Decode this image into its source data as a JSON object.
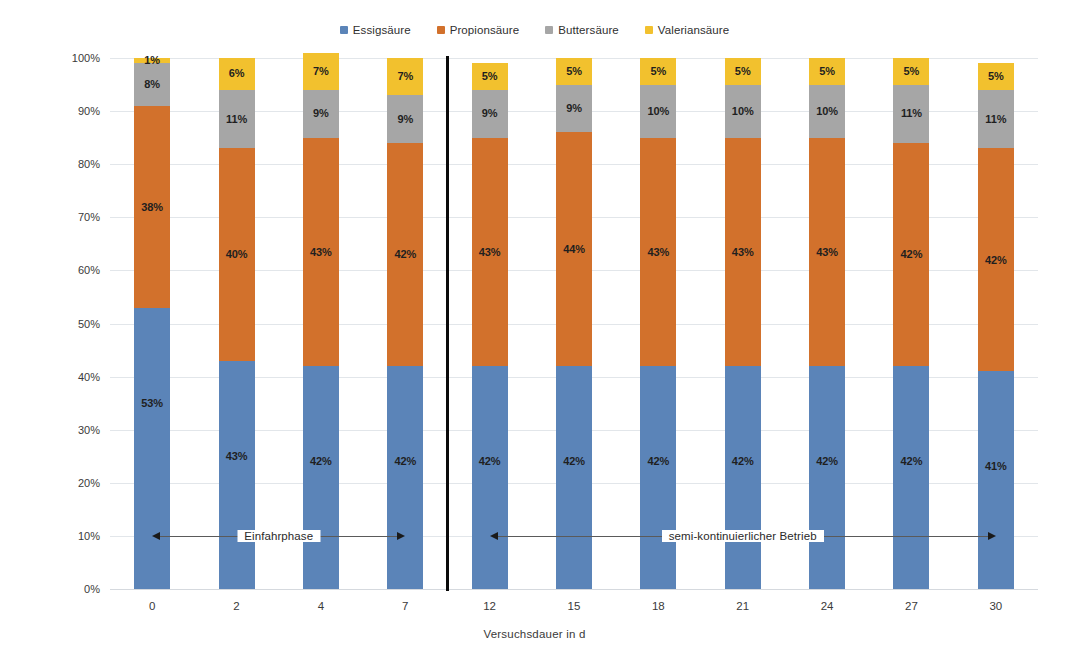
{
  "chart_data": {
    "type": "bar",
    "variant": "100% stacked column",
    "title": "",
    "xlabel": "Versuchsdauer in d",
    "ylabel": "Stoffmengenanteil",
    "categories": [
      "0",
      "2",
      "4",
      "7",
      "12",
      "15",
      "18",
      "21",
      "24",
      "27",
      "30"
    ],
    "ylim": [
      0,
      100
    ],
    "ytick_labels": [
      "0%",
      "10%",
      "20%",
      "30%",
      "40%",
      "50%",
      "60%",
      "70%",
      "80%",
      "90%",
      "100%"
    ],
    "ytick_values": [
      0,
      10,
      20,
      30,
      40,
      50,
      60,
      70,
      80,
      90,
      100
    ],
    "grid": true,
    "legend_position": "top-center",
    "series": [
      {
        "name": "Essigsäure",
        "color": "#5b84b8",
        "values": [
          53,
          43,
          42,
          42,
          42,
          42,
          42,
          42,
          42,
          42,
          41
        ],
        "labels": [
          "53%",
          "43%",
          "42%",
          "42%",
          "42%",
          "42%",
          "42%",
          "42%",
          "42%",
          "42%",
          "41%"
        ]
      },
      {
        "name": "Propionsäure",
        "color": "#d2712c",
        "values": [
          38,
          40,
          43,
          42,
          43,
          44,
          43,
          43,
          43,
          42,
          42
        ],
        "labels": [
          "38%",
          "40%",
          "43%",
          "42%",
          "43%",
          "44%",
          "43%",
          "43%",
          "43%",
          "42%",
          "42%"
        ]
      },
      {
        "name": "Buttersäure",
        "color": "#a6a6a6",
        "values": [
          8,
          11,
          9,
          9,
          9,
          9,
          10,
          10,
          10,
          11,
          11
        ],
        "labels": [
          "8%",
          "11%",
          "9%",
          "9%",
          "9%",
          "9%",
          "10%",
          "10%",
          "10%",
          "11%",
          "11%"
        ]
      },
      {
        "name": "Valeriansäure",
        "color": "#f2c12e",
        "values": [
          1,
          6,
          7,
          7,
          5,
          5,
          5,
          5,
          5,
          5,
          5
        ],
        "labels": [
          "1%",
          "6%",
          "7%",
          "7%",
          "5%",
          "5%",
          "5%",
          "5%",
          "5%",
          "5%",
          "5%"
        ]
      }
    ],
    "annotations": [
      {
        "text": "Einfahrphase",
        "from_category": "0",
        "to_category": "7",
        "style": "double-arrow",
        "y_percent": 10
      },
      {
        "text": "semi-kontinuierlicher Betrieb",
        "from_category": "12",
        "to_category": "30",
        "style": "double-arrow",
        "y_percent": 10
      }
    ],
    "dividers": [
      {
        "between": [
          "7",
          "12"
        ],
        "color": "#0a0a0a",
        "orientation": "vertical"
      }
    ]
  },
  "colors": {
    "series_1": "#5b84b8",
    "series_2": "#d2712c",
    "series_3": "#a6a6a6",
    "series_4": "#f2c12e",
    "divider": "#0a0a0a",
    "grid": "#e2e6ea",
    "text": "#3a3a3a"
  }
}
